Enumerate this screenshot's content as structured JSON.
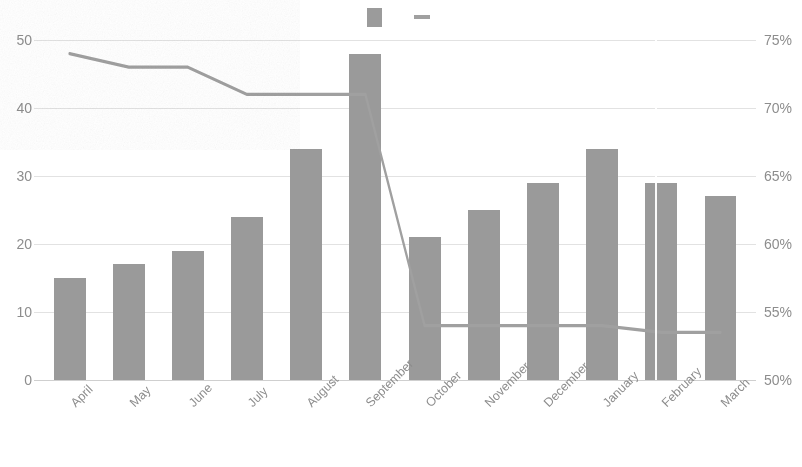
{
  "chart_data": {
    "type": "bar",
    "title": "",
    "subtitle": "",
    "xlabel": "",
    "ylabel": "",
    "y2label": "",
    "grid": true,
    "legend_position": "top-center",
    "categories": [
      "April",
      "May",
      "June",
      "July",
      "August",
      "September",
      "October",
      "November",
      "December",
      "January",
      "February",
      "March"
    ],
    "ylim": [
      0,
      50
    ],
    "y2lim": [
      50,
      75
    ],
    "yticks": [
      "0",
      "10",
      "20",
      "30",
      "40",
      "50"
    ],
    "y2ticks": [
      "50%",
      "55%",
      "60%",
      "65%",
      "70%",
      "75%"
    ],
    "series": [
      {
        "name": "",
        "marker": "bar-swatch",
        "axis": "left",
        "type": "bar",
        "color": "#9a9a9a",
        "values": [
          15,
          17,
          19,
          24,
          34,
          48,
          21,
          25,
          29,
          34,
          29,
          27
        ]
      },
      {
        "name": "",
        "marker": "line-swatch",
        "axis": "right",
        "type": "line",
        "color": "#a0a0a0",
        "values": [
          74,
          73,
          73,
          71,
          71,
          71,
          54,
          54,
          54,
          54,
          53.5,
          53.5
        ]
      }
    ]
  },
  "legend": {
    "entries": [
      {
        "label": "",
        "swatch": "bar-swatch"
      },
      {
        "label": "",
        "swatch": "line-swatch"
      }
    ]
  },
  "colors": {
    "bar": "#9a9a9a",
    "line": "#a0a0a0",
    "grid": "#e2e2e2",
    "axis_text": "#8d8d8d",
    "background": "#ffffff"
  }
}
